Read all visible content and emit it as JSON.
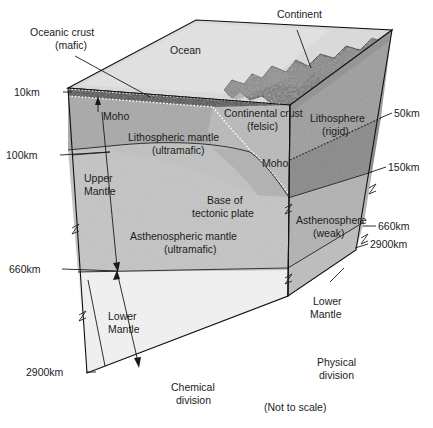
{
  "figure": {
    "note": "(Not to scale)"
  },
  "surface_labels": {
    "ocean": "Ocean",
    "continent": "Continent",
    "oceanic_crust": "Oceanic crust\n(mafic)",
    "oceanic_crust_line1": "Oceanic crust",
    "oceanic_crust_line2": "(mafic)"
  },
  "front_face_labels": {
    "moho_upper": "Moho",
    "moho_right": "Moho",
    "lithospheric_mantle_line1": "Lithospheric mantle",
    "lithospheric_mantle_line2": "(ultramafic)",
    "continental_crust_line1": "Continental crust",
    "continental_crust_line2": "(felsic)",
    "upper_mantle_line1": "Upper",
    "upper_mantle_line2": "Mantle",
    "base_tectonic_line1": "Base of",
    "base_tectonic_line2": "tectonic plate",
    "asthenospheric_mantle_line1": "Asthenospheric mantle",
    "asthenospheric_mantle_line2": "(ultramafic)",
    "lower_mantle_line1": "Lower",
    "lower_mantle_line2": "Mantle"
  },
  "side_face_labels": {
    "lithosphere_line1": "Lithosphere",
    "lithosphere_line2": "(rigid)",
    "asthenosphere_line1": "Asthenosphere",
    "asthenosphere_line2": "(weak)",
    "lower_mantle_line1": "Lower",
    "lower_mantle_line2": "Mantle"
  },
  "divisions": {
    "chemical_line1": "Chemical",
    "chemical_line2": "division",
    "physical_line1": "Physical",
    "physical_line2": "division"
  },
  "depth_left": [
    {
      "label": "10km"
    },
    {
      "label": "100km"
    },
    {
      "label": "660km"
    },
    {
      "label": "2900km"
    }
  ],
  "depth_right": [
    {
      "label": "50km"
    },
    {
      "label": "150km"
    },
    {
      "label": "660km"
    },
    {
      "label": "2900km"
    }
  ],
  "colors": {
    "background": "#ffffff",
    "ocean_top": "#d9d9d9",
    "continent_top": "#7a7a7a",
    "oceanic_crust": "#4a4a4a",
    "lithospheric_mantle": "#a6a6a6",
    "continental_crust": "#b5b5b5",
    "asthenospheric_mantle": "#c2c2c2",
    "lower_mantle_front": "#f2f2f2",
    "side_lithosphere": "#9a9a9a",
    "side_asthenosphere_upper": "#8c8c8c",
    "side_asthenosphere": "#b0b0b0",
    "side_lower_mantle": "#b8b8b8",
    "outline": "#111111",
    "text": "#1c1c1c"
  }
}
